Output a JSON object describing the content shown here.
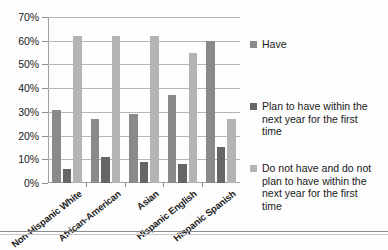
{
  "chart_data": {
    "type": "bar",
    "title": "",
    "subtitle": "",
    "xlabel": "",
    "ylabel": "",
    "categories": [
      "Non-Hispanic White",
      "African-American",
      "Asian",
      "Hispanic English",
      "Hispanic Spanish"
    ],
    "series": [
      {
        "name": "Have",
        "color": "#8a8a8a",
        "values": [
          31,
          27,
          29,
          37,
          60
        ]
      },
      {
        "name": "Plan to have within the next year for the first time",
        "color": "#666666",
        "values": [
          6,
          11,
          9,
          8,
          15
        ]
      },
      {
        "name": "Do not have and do not plan to have within the next year for the first time",
        "color": "#b4b4b4",
        "values": [
          62,
          62,
          62,
          55,
          27
        ]
      }
    ],
    "ylim": [
      0,
      70
    ],
    "ytick_step": 10,
    "ytick_labels": [
      "0%",
      "10%",
      "20%",
      "30%",
      "40%",
      "50%",
      "60%",
      "70%"
    ],
    "ytick_values": [
      0,
      10,
      20,
      30,
      40,
      50,
      60,
      70
    ],
    "grid": "horizontal",
    "legend_position": "right",
    "legend": [
      "Have",
      "Plan to have within the next year for the first time",
      "Do not have and do not plan to have within the next year for the first time"
    ]
  }
}
